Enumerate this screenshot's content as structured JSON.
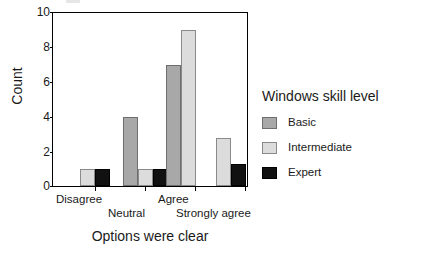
{
  "chart_data": {
    "type": "bar",
    "title": "",
    "xlabel": "Options were clear",
    "ylabel": "Count",
    "ylim": [
      0,
      10
    ],
    "yticks": [
      0,
      2,
      4,
      6,
      8,
      10
    ],
    "ytick_labels": [
      "0",
      "2",
      "4",
      "6",
      "8",
      "10"
    ],
    "categories": [
      "Disagree",
      "Neutral",
      "Agree",
      "Strongly agree"
    ],
    "grid": false,
    "legend_position": "right",
    "legend_title": "Windows skill level",
    "series": [
      {
        "name": "Basic",
        "color": "#a8a8a8",
        "values": [
          0,
          4,
          7,
          0
        ]
      },
      {
        "name": "Intermediate",
        "color": "#dcdcdc",
        "values": [
          1,
          1,
          9,
          2.8
        ]
      },
      {
        "name": "Expert",
        "color": "#111111",
        "values": [
          1,
          1,
          0,
          1.3
        ]
      }
    ]
  },
  "axes": {
    "y_title": "Count",
    "x_title": "Options were clear",
    "y_labels": [
      "10",
      "8",
      "6",
      "4",
      "2",
      "0"
    ],
    "x_labels": [
      "Disagree",
      "Neutral",
      "Agree",
      "Strongly agree"
    ]
  },
  "legend": {
    "title": "Windows skill level",
    "items": [
      {
        "label": "Basic",
        "swatch": "basic"
      },
      {
        "label": "Intermediate",
        "swatch": "intermediate"
      },
      {
        "label": "Expert",
        "swatch": "expert"
      }
    ]
  }
}
